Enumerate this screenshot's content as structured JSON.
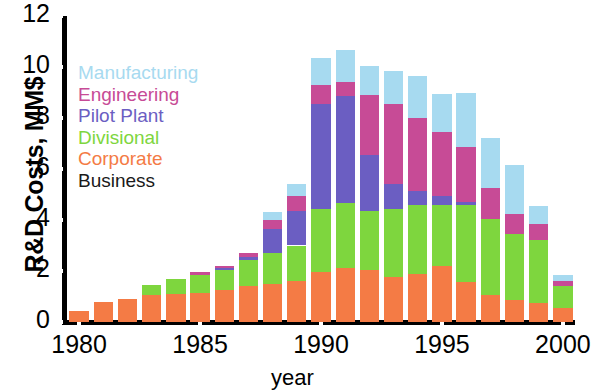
{
  "chart_data": {
    "type": "bar",
    "stacked": true,
    "title": "",
    "xlabel": "year",
    "ylabel": "R&D Costs, MM$",
    "categories": [
      1980,
      1981,
      1982,
      1983,
      1984,
      1985,
      1986,
      1987,
      1988,
      1989,
      1990,
      1991,
      1992,
      1993,
      1994,
      1995,
      1996,
      1997,
      1998,
      1999,
      2000
    ],
    "x_tick_labels": [
      "1980",
      "1985",
      "1990",
      "1995",
      "2000"
    ],
    "x_tick_values": [
      1980,
      1985,
      1990,
      1995,
      2000
    ],
    "y_tick_labels": [
      "0",
      "2",
      "4",
      "6",
      "8",
      "10",
      "12"
    ],
    "y_tick_values": [
      0,
      2,
      4,
      6,
      8,
      10,
      12
    ],
    "ylim": [
      0,
      12
    ],
    "xlim": [
      1979.5,
      2000.5
    ],
    "grid": false,
    "legend_position": "upper-left-inside",
    "series": [
      {
        "name": "Business",
        "color": "#1a1a1a",
        "values": [
          0,
          0,
          0,
          0,
          0,
          0,
          0,
          0,
          0,
          0,
          0,
          0,
          0,
          0,
          0,
          0,
          0,
          0,
          0,
          0,
          0
        ]
      },
      {
        "name": "Corporate",
        "color": "#f47b45",
        "values": [
          0.45,
          0.8,
          0.9,
          1.05,
          1.1,
          1.15,
          1.25,
          1.4,
          1.5,
          1.6,
          1.95,
          2.1,
          2.05,
          1.75,
          1.9,
          2.2,
          1.55,
          1.05,
          0.85,
          0.75,
          0.55
        ]
      },
      {
        "name": "Divisional",
        "color": "#7ed63e",
        "values": [
          0,
          0,
          0,
          0.4,
          0.6,
          0.7,
          0.8,
          1.05,
          1.2,
          1.4,
          2.5,
          2.55,
          2.3,
          2.7,
          2.7,
          2.4,
          3.05,
          3.0,
          2.6,
          2.45,
          0.85
        ]
      },
      {
        "name": "Pilot Plant",
        "color": "#6b5ec2",
        "values": [
          0,
          0,
          0,
          0,
          0,
          0,
          0.05,
          0.1,
          0.95,
          1.35,
          4.1,
          4.2,
          2.2,
          0.95,
          0.55,
          0.35,
          0.1,
          0,
          0,
          0,
          0
        ]
      },
      {
        "name": "Engineering",
        "color": "#c74b96",
        "values": [
          0,
          0,
          0,
          0,
          0,
          0.1,
          0.1,
          0.15,
          0.35,
          0.6,
          0.75,
          0.55,
          2.35,
          3.15,
          2.85,
          2.5,
          2.15,
          1.2,
          0.8,
          0.65,
          0.2
        ]
      },
      {
        "name": "Manufacturing",
        "color": "#a7daf0",
        "values": [
          0,
          0,
          0,
          0,
          0,
          0,
          0,
          0,
          0.3,
          0.45,
          1.05,
          1.25,
          1.15,
          1.3,
          1.65,
          1.5,
          2.15,
          1.95,
          1.9,
          0.7,
          0.25
        ]
      }
    ],
    "legend_order": [
      "Manufacturing",
      "Engineering",
      "Pilot Plant",
      "Divisional",
      "Corporate",
      "Business"
    ]
  },
  "axes": {
    "ylabel": "R&D Costs, MM$",
    "xlabel": "year"
  }
}
